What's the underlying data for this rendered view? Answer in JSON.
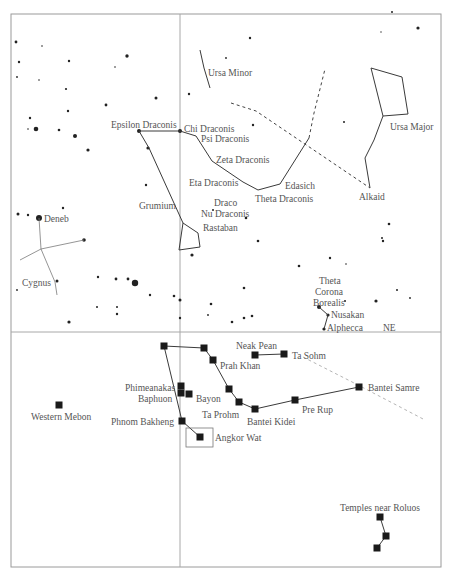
{
  "header": {
    "top_text": ""
  },
  "frame": {
    "left": 11,
    "top": 14,
    "right": 441,
    "bottom": 567,
    "vdiv_x": 180,
    "hdiv_y": 332
  },
  "colors": {
    "frame": "#9a9a9a",
    "line": "#3a3a3a",
    "star": "#222222",
    "label": "#555555",
    "dashed_light": "#b5b5b5"
  },
  "constellations": [
    {
      "name": "Ursa Minor",
      "label": {
        "text": "Ursa Minor",
        "x": 208,
        "y": 76
      },
      "lines": [
        [
          [
            200,
            50
          ],
          [
            204,
            68
          ],
          [
            210,
            88
          ]
        ]
      ]
    },
    {
      "name": "Ursa Major",
      "label": {
        "text": "Ursa Major",
        "x": 390,
        "y": 130
      },
      "lines": [
        [
          [
            371,
            68
          ],
          [
            402,
            77
          ],
          [
            408,
            114
          ],
          [
            383,
            116
          ],
          [
            371,
            68
          ]
        ],
        [
          [
            383,
            116
          ],
          [
            374,
            140
          ],
          [
            365,
            158
          ],
          [
            370,
            188
          ]
        ]
      ]
    },
    {
      "name": "Draco",
      "label": {
        "text": "Draco",
        "x": 214,
        "y": 206
      },
      "lines": [
        [
          [
            139,
            131
          ],
          [
            180,
            131
          ],
          [
            196,
            136
          ],
          [
            212,
            161
          ],
          [
            243,
            182
          ],
          [
            258,
            190
          ],
          [
            280,
            184
          ],
          [
            309,
            138
          ]
        ],
        [
          [
            139,
            131
          ],
          [
            149,
            148
          ],
          [
            183,
            223
          ],
          [
            198,
            233
          ],
          [
            200,
            247
          ],
          [
            179,
            250
          ],
          [
            183,
            223
          ]
        ]
      ]
    },
    {
      "name": "Cygnus",
      "label": {
        "text": "Cygnus",
        "x": 22,
        "y": 286
      },
      "lines": [
        [
          [
            39,
            218
          ],
          [
            41,
            249
          ],
          [
            84,
            240
          ]
        ],
        [
          [
            41,
            249
          ],
          [
            20,
            260
          ]
        ],
        [
          [
            41,
            249
          ],
          [
            55,
            282
          ],
          [
            57,
            295
          ]
        ]
      ]
    },
    {
      "name": "Corona Borealis",
      "label": {
        "text": "Theta Corona Borealis",
        "lines": [
          "Theta",
          "Corona",
          "Borealis"
        ],
        "x": 315,
        "y": 284
      },
      "lines": [
        [
          [
            319,
            307
          ],
          [
            328,
            315
          ],
          [
            324,
            329
          ]
        ]
      ]
    }
  ],
  "dashed_lines": [
    {
      "style": "dark",
      "points": [
        [
          231,
          103
        ],
        [
          256,
          111
        ],
        [
          370,
          188
        ]
      ]
    },
    {
      "style": "dark",
      "points": [
        [
          309,
          138
        ],
        [
          314,
          113
        ],
        [
          325,
          69
        ]
      ]
    },
    {
      "style": "light",
      "points": [
        [
          303,
          357
        ],
        [
          358,
          385
        ],
        [
          425,
          420
        ]
      ]
    }
  ],
  "star_labels": [
    {
      "text": "Epsilon Draconis",
      "x": 111,
      "y": 128
    },
    {
      "text": "Chi Draconis",
      "x": 184,
      "y": 132
    },
    {
      "text": "Psi Draconis",
      "x": 201,
      "y": 142
    },
    {
      "text": "Zeta Draconis",
      "x": 216,
      "y": 163
    },
    {
      "text": "Eta Draconis",
      "x": 189,
      "y": 186
    },
    {
      "text": "Edasich",
      "x": 285,
      "y": 189
    },
    {
      "text": "Theta Draconis",
      "x": 255,
      "y": 202
    },
    {
      "text": "Alkaid",
      "x": 359,
      "y": 200
    },
    {
      "text": "Grumium",
      "x": 139,
      "y": 209
    },
    {
      "text": "Nu Draconis",
      "x": 201,
      "y": 217
    },
    {
      "text": "Rastaban",
      "x": 203,
      "y": 231
    },
    {
      "text": "Deneb",
      "x": 44,
      "y": 222
    },
    {
      "text": "Nusakan",
      "x": 331,
      "y": 318
    },
    {
      "text": "Alphecca",
      "x": 327,
      "y": 331
    },
    {
      "text": "NE",
      "x": 383,
      "y": 331
    }
  ],
  "stars": [
    [
      16,
      42,
      1.4
    ],
    [
      42,
      46,
      0.8
    ],
    [
      19,
      62,
      1.2
    ],
    [
      69,
      61,
      1.2
    ],
    [
      127,
      56,
      1.7
    ],
    [
      115,
      67,
      0.8
    ],
    [
      17,
      77,
      0.9
    ],
    [
      39,
      80,
      0.8
    ],
    [
      66,
      89,
      1.1
    ],
    [
      156,
      98,
      1.5
    ],
    [
      106,
      105,
      1.4
    ],
    [
      68,
      111,
      1.2
    ],
    [
      30,
      118,
      1.2
    ],
    [
      36,
      129,
      2.3
    ],
    [
      59,
      130,
      1.3
    ],
    [
      75,
      136,
      2.0
    ],
    [
      28,
      129,
      0.8
    ],
    [
      88,
      150,
      1.6
    ],
    [
      148,
      148,
      1.6
    ],
    [
      139,
      131,
      2.0
    ],
    [
      180,
      131,
      2.0
    ],
    [
      250,
      38,
      1.2
    ],
    [
      418,
      28,
      1.6
    ],
    [
      381,
      32,
      0.7
    ],
    [
      189,
      94,
      1.2
    ],
    [
      226,
      58,
      0.9
    ],
    [
      253,
      125,
      1.2
    ],
    [
      344,
      122,
      1.0
    ],
    [
      146,
      185,
      1.2
    ],
    [
      28,
      215,
      1.2
    ],
    [
      18,
      214,
      1.5
    ],
    [
      39,
      218,
      3.0
    ],
    [
      84,
      240,
      1.8
    ],
    [
      63,
      208,
      1.2
    ],
    [
      57,
      281,
      1.5
    ],
    [
      98,
      277,
      1.2
    ],
    [
      116,
      279,
      1.4
    ],
    [
      135,
      283,
      3.2
    ],
    [
      128,
      279,
      1.4
    ],
    [
      150,
      295,
      1.2
    ],
    [
      174,
      296,
      1.3
    ],
    [
      117,
      314,
      1.2
    ],
    [
      69,
      322,
      1.6
    ],
    [
      97,
      307,
      1.0
    ],
    [
      117,
      307,
      1.0
    ],
    [
      17,
      290,
      0.9
    ],
    [
      192,
      255,
      1.6
    ],
    [
      213,
      210,
      1.0
    ],
    [
      389,
      224,
      1.3
    ],
    [
      382,
      238,
      1.0
    ],
    [
      246,
      218,
      1.3
    ],
    [
      258,
      241,
      1.3
    ],
    [
      299,
      266,
      1.3
    ],
    [
      180,
      300,
      1.5
    ],
    [
      180,
      318,
      1.2
    ],
    [
      244,
      288,
      1.3
    ],
    [
      211,
      304,
      1.3
    ],
    [
      244,
      318,
      1.3
    ],
    [
      232,
      322,
      1.3
    ],
    [
      252,
      316,
      1.3
    ],
    [
      208,
      315,
      0.9
    ],
    [
      319,
      307,
      2.0
    ],
    [
      328,
      315,
      1.6
    ],
    [
      324,
      329,
      1.6
    ],
    [
      376,
      301,
      1.6
    ],
    [
      383,
      241,
      1.2
    ],
    [
      330,
      258,
      1.2
    ],
    [
      345,
      301,
      1.0
    ],
    [
      346,
      264,
      0.8
    ],
    [
      392,
      12,
      1.0
    ],
    [
      397,
      290,
      1.0
    ],
    [
      410,
      298,
      0.9
    ]
  ],
  "temples": [
    {
      "name": "",
      "x": 164,
      "y": 346
    },
    {
      "name": "",
      "x": 204,
      "y": 348
    },
    {
      "name": "Prah Khan",
      "x": 213,
      "y": 360,
      "label": {
        "x": 220,
        "y": 369
      }
    },
    {
      "name": "Neak Pean",
      "x": 255,
      "y": 355,
      "label": {
        "x": 236,
        "y": 349
      }
    },
    {
      "name": "Ta Sohm",
      "x": 284,
      "y": 354,
      "label": {
        "x": 292,
        "y": 359
      }
    },
    {
      "name": "Phimeanakas",
      "x": 181,
      "y": 386,
      "label": {
        "x": 125,
        "y": 391
      }
    },
    {
      "name": "Baphuon",
      "x": 181,
      "y": 393,
      "label": {
        "x": 138,
        "y": 402
      }
    },
    {
      "name": "",
      "x": 189,
      "y": 394
    },
    {
      "name": "Bayon",
      "x": 0,
      "y": 0,
      "label": {
        "x": 196,
        "y": 402
      }
    },
    {
      "name": "",
      "x": 229,
      "y": 389
    },
    {
      "name": "",
      "x": 239,
      "y": 402
    },
    {
      "name": "Ta Prohm",
      "x": 0,
      "y": 0,
      "label": {
        "x": 202,
        "y": 418
      }
    },
    {
      "name": "Bantei Kidei",
      "x": 255,
      "y": 409,
      "label": {
        "x": 247,
        "y": 425
      }
    },
    {
      "name": "Pre Rup",
      "x": 295,
      "y": 400,
      "label": {
        "x": 302,
        "y": 413
      }
    },
    {
      "name": "Bantei Samre",
      "x": 359,
      "y": 387,
      "label": {
        "x": 368,
        "y": 391
      }
    },
    {
      "name": "Phnom Bakheng",
      "x": 182,
      "y": 421,
      "label": {
        "x": 111,
        "y": 425
      }
    },
    {
      "name": "Angkor Wat",
      "x": 200,
      "y": 437,
      "label": {
        "x": 215,
        "y": 441
      }
    },
    {
      "name": "Western Mebon",
      "x": 59,
      "y": 405,
      "label": {
        "x": 31,
        "y": 420
      }
    },
    {
      "name": "Temples near Roluos",
      "x": 380,
      "y": 517,
      "label": {
        "x": 340,
        "y": 511
      }
    },
    {
      "name": "",
      "x": 386,
      "y": 536
    },
    {
      "name": "",
      "x": 377,
      "y": 548
    }
  ],
  "temple_lines": [
    [
      [
        164,
        346
      ],
      [
        182,
        421
      ],
      [
        200,
        437
      ]
    ],
    [
      [
        164,
        346
      ],
      [
        204,
        348
      ],
      [
        213,
        360
      ],
      [
        229,
        389
      ],
      [
        239,
        402
      ],
      [
        255,
        409
      ],
      [
        295,
        400
      ],
      [
        359,
        387
      ]
    ],
    [
      [
        255,
        355
      ],
      [
        284,
        354
      ]
    ],
    [
      [
        380,
        517
      ],
      [
        386,
        536
      ],
      [
        377,
        548
      ]
    ]
  ],
  "angkor_box": {
    "x": 186,
    "y": 428,
    "w": 27,
    "h": 19
  }
}
